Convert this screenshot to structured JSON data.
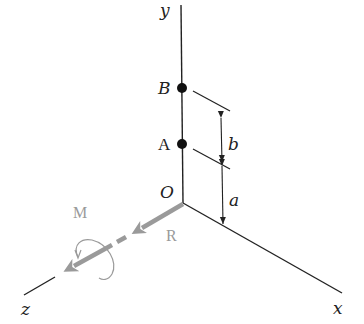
{
  "diagram": {
    "title": "",
    "axes": {
      "x_label": "x",
      "y_label": "y",
      "z_label": "z",
      "origin_label": "O"
    },
    "points": [
      {
        "id": "B",
        "label": "B"
      },
      {
        "id": "A",
        "label": "A"
      }
    ],
    "dimensions": [
      {
        "id": "b",
        "label": "b",
        "from": "A",
        "to": "B"
      },
      {
        "id": "a",
        "label": "a",
        "from": "O",
        "to": "A"
      }
    ],
    "vectors": {
      "resultant_label": "R",
      "moment_label": "M"
    },
    "colors": {
      "axis": "#222222",
      "vector": "#9a9a9a",
      "point": "#111111"
    }
  }
}
